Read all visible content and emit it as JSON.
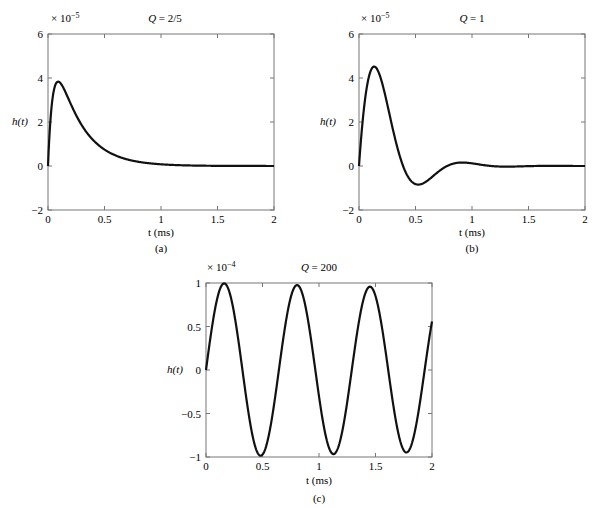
{
  "chart_data": [
    {
      "id": "a",
      "type": "line",
      "title": "Q = 2/5",
      "title_q": "Q",
      "title_val": " = 2/5",
      "caption": "(a)",
      "xlabel": "t (ms)",
      "ylabel": "h(t)",
      "multiplier": "× 10",
      "multiplier_exp": "−5",
      "xlim": [
        0,
        2
      ],
      "ylim": [
        -2,
        6
      ],
      "xticks": [
        "0",
        "0.5",
        "1",
        "1.5",
        "2"
      ],
      "yticks": [
        "−2",
        "0",
        "2",
        "4",
        "6"
      ],
      "series": [
        {
          "name": "h(t)",
          "model": {
            "kind": "overdamped",
            "Q": 0.4,
            "scale": 1e-05
          }
        }
      ],
      "x": [
        0,
        0.05,
        0.1,
        0.15,
        0.2,
        0.3,
        0.4,
        0.5,
        0.6,
        0.7,
        0.8,
        0.9,
        1.0,
        1.5,
        2.0
      ],
      "values": [
        0,
        2.8,
        3.1,
        2.85,
        2.4,
        1.6,
        1.0,
        0.6,
        0.33,
        0.17,
        0.07,
        0.02,
        0,
        0,
        0
      ]
    },
    {
      "id": "b",
      "type": "line",
      "title": "Q = 1",
      "title_q": "Q",
      "title_val": " = 1",
      "caption": "(b)",
      "xlabel": "t (ms)",
      "ylabel": "h(t)",
      "multiplier": "× 10",
      "multiplier_exp": "−5",
      "xlim": [
        0,
        2
      ],
      "ylim": [
        -2,
        6
      ],
      "xticks": [
        "0",
        "0.5",
        "1",
        "1.5",
        "2"
      ],
      "yticks": [
        "−2",
        "0",
        "2",
        "4",
        "6"
      ],
      "series": [
        {
          "name": "h(t)",
          "model": {
            "kind": "underdamped",
            "Q": 1,
            "scale": 1e-05
          }
        }
      ],
      "x": [
        0,
        0.05,
        0.1,
        0.2,
        0.3,
        0.4,
        0.5,
        0.6,
        0.7,
        0.85,
        1.0,
        1.2,
        1.5,
        2.0
      ],
      "values": [
        0,
        4.8,
        5.45,
        4.0,
        1.5,
        -0.3,
        -0.85,
        -0.5,
        0.05,
        0.2,
        0.1,
        0,
        0,
        0
      ]
    },
    {
      "id": "c",
      "type": "line",
      "title": "Q = 200",
      "title_q": "Q",
      "title_val": " = 200",
      "caption": "(c)",
      "xlabel": "t (ms)",
      "ylabel": "h(t)",
      "multiplier": "× 10",
      "multiplier_exp": "−4",
      "xlim": [
        0,
        2
      ],
      "ylim": [
        -1,
        1
      ],
      "xticks": [
        "0",
        "0.5",
        "1",
        "1.5",
        "2"
      ],
      "yticks": [
        "−1",
        "−0.5",
        "0",
        "0.5",
        "1"
      ],
      "series": [
        {
          "name": "h(t)",
          "model": {
            "kind": "lightly-damped",
            "Q": 200,
            "period_ms": 0.645,
            "scale": 0.0001
          }
        }
      ],
      "x": [
        0,
        0.16,
        0.48,
        0.81,
        1.13,
        1.45,
        1.78,
        2.0
      ],
      "values": [
        0,
        1.0,
        -0.99,
        0.97,
        -0.96,
        0.95,
        -0.94,
        0.75
      ]
    }
  ]
}
